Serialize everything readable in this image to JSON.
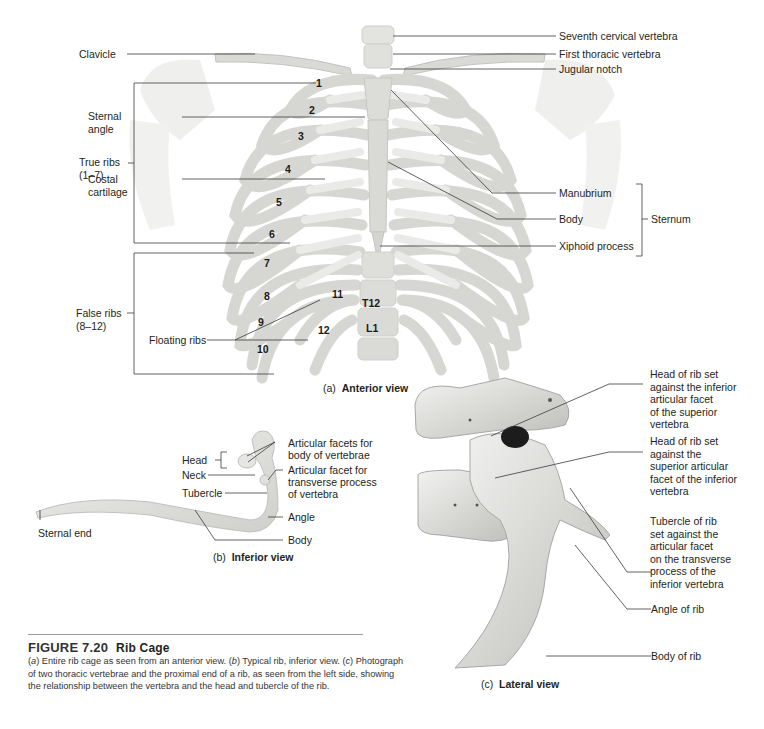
{
  "anterior": {
    "caption_prefix": "(a)",
    "caption_title": "Anterior view",
    "labels": {
      "clavicle": "Clavicle",
      "sternal_angle_1": "Sternal",
      "sternal_angle_2": "angle",
      "true_ribs_1": "True ribs",
      "true_ribs_2": "(1–7)",
      "costal_cartilage_1": "Costal",
      "costal_cartilage_2": "cartilage",
      "false_ribs_1": "False ribs",
      "false_ribs_2": "(8–12)",
      "floating_ribs": "Floating ribs",
      "seventh_cervical": "Seventh cervical vertebra",
      "first_thoracic": "First thoracic vertebra",
      "jugular_notch": "Jugular notch",
      "manubrium": "Manubrium",
      "body": "Body",
      "xiphoid": "Xiphoid process",
      "sternum": "Sternum"
    },
    "rib_numbers": [
      "1",
      "2",
      "3",
      "4",
      "5",
      "6",
      "7",
      "8",
      "9",
      "10",
      "11",
      "12"
    ],
    "vertebrae": [
      "T12",
      "L1"
    ]
  },
  "inferior": {
    "caption_prefix": "(b)",
    "caption_title": "Inferior view",
    "labels": {
      "head": "Head",
      "neck": "Neck",
      "tubercle": "Tubercle",
      "sternal_end": "Sternal end",
      "articular_facets_1": "Articular facets for",
      "articular_facets_2": "body of vertebrae",
      "articular_facet_1": "Articular facet for",
      "articular_facet_2": "transverse process",
      "articular_facet_3": "of vertebra",
      "angle": "Angle",
      "body": "Body"
    }
  },
  "lateral": {
    "caption_prefix": "(c)",
    "caption_title": "Lateral view",
    "labels": {
      "head_inferior_facet": [
        "Head of rib set",
        "against the inferior",
        "articular facet",
        "of the superior",
        "vertebra"
      ],
      "head_superior_facet": [
        "Head of rib set",
        "against the",
        "superior articular",
        "facet of the inferior",
        "vertebra"
      ],
      "tubercle": [
        "Tubercle of rib",
        "set against the",
        "articular facet",
        "on the transverse",
        "process of the",
        "inferior vertebra"
      ],
      "angle_of_rib": "Angle of rib",
      "body_of_rib": "Body of rib"
    }
  },
  "figure": {
    "number": "FIGURE 7.20",
    "title": "Rib Cage",
    "caption_parts": [
      {
        "text": "(",
        "italic": false
      },
      {
        "text": "a",
        "italic": true
      },
      {
        "text": ") Entire rib cage as seen from an anterior view. (",
        "italic": false
      },
      {
        "text": "b",
        "italic": true
      },
      {
        "text": ") Typical rib, inferior view. (",
        "italic": false
      },
      {
        "text": "c",
        "italic": true
      },
      {
        "text": ") Photograph of two thoracic vertebrae and the proximal end of a rib, as seen from the left side, showing the relationship between the vertebra and the head and tubercle of the rib.",
        "italic": false
      }
    ]
  },
  "colors": {
    "bone": "#e6e6e4",
    "bone_shadow": "#c9c9c7",
    "leader_line": "#3a3a3a",
    "text": "#231f20"
  }
}
